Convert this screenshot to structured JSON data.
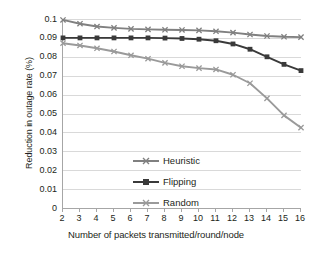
{
  "chart_data": {
    "type": "line",
    "title": "",
    "xlabel": "Number of packets transmitted/round/node",
    "ylabel": "Reduction in outage rate (%)",
    "x": [
      2,
      3,
      4,
      5,
      6,
      7,
      8,
      9,
      10,
      11,
      12,
      13,
      14,
      15,
      16
    ],
    "xlim": [
      2,
      16
    ],
    "ylim": [
      0,
      0.1
    ],
    "xtick_labels": [
      "2",
      "3",
      "4",
      "5",
      "6",
      "7",
      "8",
      "9",
      "10",
      "11",
      "12",
      "13",
      "14",
      "15",
      "16"
    ],
    "ytick_labels": [
      "0",
      "0.01",
      "0.02",
      "0.03",
      "0.04",
      "0.05",
      "0.06",
      "0.07",
      "0.08",
      "0.09",
      "0.1"
    ],
    "ytick_values": [
      0,
      0.01,
      0.02,
      0.03,
      0.04,
      0.05,
      0.06,
      0.07,
      0.08,
      0.09,
      0.1
    ],
    "grid": "horizontal",
    "legend_position": "inside-lower-left",
    "series": [
      {
        "name": "Heuristic",
        "color": "#808080",
        "marker": "cross",
        "values": [
          0.0995,
          0.0975,
          0.096,
          0.0953,
          0.0948,
          0.0945,
          0.0943,
          0.0942,
          0.094,
          0.0935,
          0.0928,
          0.0918,
          0.091,
          0.0906,
          0.0904
        ]
      },
      {
        "name": "Flipping",
        "color": "#3a3a3a",
        "marker": "square",
        "values": [
          0.09,
          0.09,
          0.09,
          0.09,
          0.09,
          0.09,
          0.0899,
          0.0897,
          0.0893,
          0.0885,
          0.0868,
          0.084,
          0.08,
          0.076,
          0.0727
        ]
      },
      {
        "name": "Random",
        "color": "#9a9a9a",
        "marker": "cross",
        "values": [
          0.0872,
          0.086,
          0.0845,
          0.0828,
          0.0808,
          0.079,
          0.0768,
          0.075,
          0.074,
          0.0733,
          0.0705,
          0.066,
          0.058,
          0.049,
          0.0425
        ]
      }
    ]
  },
  "legend": {
    "items": [
      {
        "label": "Heuristic"
      },
      {
        "label": "Flipping"
      },
      {
        "label": "Random"
      }
    ]
  }
}
